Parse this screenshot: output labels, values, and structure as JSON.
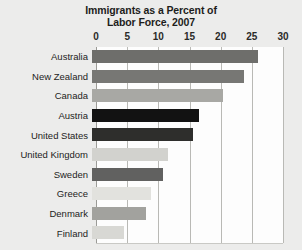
{
  "chart_data": {
    "type": "bar",
    "orientation": "horizontal",
    "title": "Immigrants as a Percent of Labor Force, 2007",
    "title_line1": "Immigrants as a Percent of",
    "title_line2": "Labor Force, 2007",
    "xlabel": "",
    "ylabel": "",
    "xlim": [
      0,
      30
    ],
    "xticks": [
      0,
      5,
      10,
      15,
      20,
      25,
      30
    ],
    "xtick_labels": [
      "0",
      "5",
      "10",
      "15",
      "20",
      "25",
      "30"
    ],
    "grid": "vertical",
    "legend": "none",
    "categories": [
      "Australia",
      "New Zealand",
      "Canada",
      "Austria",
      "United States",
      "United Kingdom",
      "Sweden",
      "Greece",
      "Denmark",
      "Finland"
    ],
    "values": [
      26.6,
      24.4,
      21.0,
      17.2,
      16.2,
      12.2,
      11.4,
      9.5,
      8.6,
      5.1
    ],
    "bars": [
      {
        "label": "Australia",
        "value": 26.6,
        "color": "#6e6e6b"
      },
      {
        "label": "New Zealand",
        "value": 24.4,
        "color": "#777774"
      },
      {
        "label": "Canada",
        "value": 21.0,
        "color": "#a8a8a4"
      },
      {
        "label": "Austria",
        "value": 17.2,
        "color": "#121212"
      },
      {
        "label": "United States",
        "value": 16.2,
        "color": "#2e2e2c"
      },
      {
        "label": "United Kingdom",
        "value": 12.2,
        "color": "#d2d2ce"
      },
      {
        "label": "Sweden",
        "value": 11.4,
        "color": "#616160"
      },
      {
        "label": "Greece",
        "value": 9.5,
        "color": "#e2e2de"
      },
      {
        "label": "Denmark",
        "value": 8.6,
        "color": "#a2a29e"
      },
      {
        "label": "Finland",
        "value": 5.1,
        "color": "#d8d8d4"
      }
    ],
    "colors": {
      "background": "#ececeb",
      "plot_background": "#fdfdfd",
      "gridline": "#b9b9b5",
      "axis": "#9b9b97",
      "text": "#1d1d1b",
      "highlight_bar": "#121212"
    }
  }
}
